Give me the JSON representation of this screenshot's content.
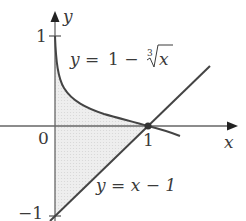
{
  "figure": {
    "axes": {
      "x_label": "x",
      "y_label": "y",
      "origin_label": "0",
      "x_tick_label": "1",
      "y_tick_top_label": "1",
      "y_tick_bottom_label": "−1"
    },
    "curves": {
      "cube_root": {
        "lhs": "y = ",
        "rhs_prefix": "1 − ",
        "root_index": "3",
        "radicand": "x"
      },
      "line": {
        "label": "y = x − 1"
      }
    },
    "intersection_point": "(1, 0)",
    "colors": {
      "curve": "#4a4a4a",
      "axis": "#555555",
      "shade": "#e6e6e6",
      "text": "#3a3a3a"
    }
  }
}
